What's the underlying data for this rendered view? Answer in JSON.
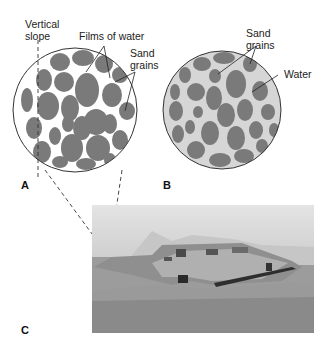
{
  "figure": {
    "panels": [
      {
        "id": "A",
        "label": "A",
        "annotations": [
          "Vertical slope",
          "Films of water",
          "Sand grains"
        ]
      },
      {
        "id": "B",
        "label": "B",
        "annotations": [
          "Sand grains",
          "Water"
        ]
      },
      {
        "id": "C",
        "label": "C",
        "description": "Photograph of a sand castle with vertical walls"
      }
    ],
    "labels": {
      "vertical_slope_1": "Vertical",
      "vertical_slope_2": "slope",
      "films_of_water": "Films of water",
      "sand_grains_a_1": "Sand",
      "sand_grains_a_2": "grains",
      "sand_grains_b_1": "Sand",
      "sand_grains_b_2": "grains",
      "water": "Water",
      "panel_a": "A",
      "panel_b": "B",
      "panel_c": "C"
    },
    "colors": {
      "grain": "#7a7a7a",
      "water_fill_b": "#d6d6d6",
      "outline": "#333333"
    }
  }
}
